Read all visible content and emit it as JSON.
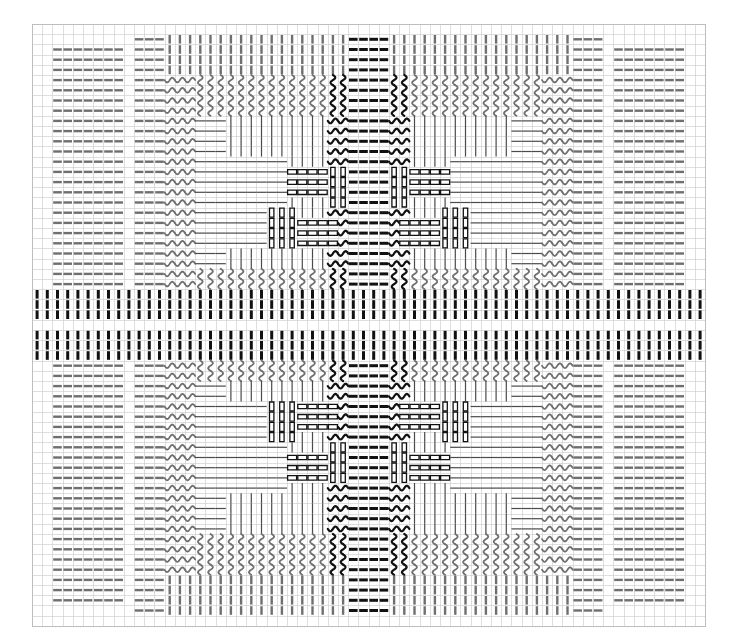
{
  "document": {
    "title": "Woven Textile Draft Pattern Chart",
    "kind": "pattern-grid",
    "canvas": {
      "width": 732,
      "height": 640,
      "background": "#ffffff"
    }
  },
  "grid": {
    "origin_x": 32,
    "origin_y": 24,
    "cell": 10.2,
    "cols": 66,
    "rows": 59,
    "line_color": "#c8c8c8",
    "line_width": 0.6,
    "show": true
  },
  "palette": {
    "dark": "#111111",
    "mid": "#6f6f6f",
    "light_grid": "#c8c8c8",
    "paper": "#ffffff"
  },
  "motifs": {
    "hdash_mid": {
      "name": "horizontal-dash-mid",
      "color": "#6f6f6f",
      "weight": 2.4
    },
    "hdash_dark": {
      "name": "horizontal-dash-dark",
      "color": "#111111",
      "weight": 3.0
    },
    "vdash_mid": {
      "name": "vertical-dash-mid",
      "color": "#6f6f6f",
      "weight": 2.4
    },
    "vdash_dark": {
      "name": "vertical-dash-dark",
      "color": "#111111",
      "weight": 3.0
    },
    "hwave_mid": {
      "name": "horizontal-wave-mid",
      "color": "#6f6f6f",
      "weight": 1.8
    },
    "hwave_dark": {
      "name": "horizontal-wave-dark",
      "color": "#111111",
      "weight": 2.2
    },
    "vwave_mid": {
      "name": "vertical-wave-mid",
      "color": "#6f6f6f",
      "weight": 1.8
    },
    "vwave_dark": {
      "name": "vertical-wave-dark",
      "color": "#111111",
      "weight": 2.2
    },
    "hline_thin": {
      "name": "horizontal-thin-line",
      "color": "#4a4a4a",
      "weight": 1.2
    },
    "vline_thin": {
      "name": "vertical-thin-line",
      "color": "#4a4a4a",
      "weight": 1.2
    },
    "hbar_outline": {
      "name": "horizontal-bar-outline",
      "color": "#111111",
      "weight": 1.3
    },
    "vbar_outline": {
      "name": "vertical-bar-outline",
      "color": "#111111",
      "weight": 1.3
    },
    "blank": {
      "name": "blank-cell",
      "color": "#ffffff",
      "weight": 0
    }
  },
  "chart_data": {
    "type": "heatmap",
    "xlabel": "",
    "ylabel": "",
    "cols": 66,
    "rows": 59,
    "legend": [
      {
        "key": "hdash_mid",
        "label": "horizontal dash (medium)"
      },
      {
        "key": "vdash_mid",
        "label": "vertical dash (medium)"
      },
      {
        "key": "hdash_dark",
        "label": "horizontal dash (dark)"
      },
      {
        "key": "vdash_dark",
        "label": "vertical dash (dark)"
      },
      {
        "key": "hwave_mid",
        "label": "horizontal wave (medium)"
      },
      {
        "key": "vwave_mid",
        "label": "vertical wave (medium)"
      },
      {
        "key": "hwave_dark",
        "label": "horizontal wave (dark)"
      },
      {
        "key": "vwave_dark",
        "label": "vertical wave (dark)"
      },
      {
        "key": "hline_thin",
        "label": "horizontal thin line"
      },
      {
        "key": "vline_thin",
        "label": "vertical thin line"
      },
      {
        "key": "hbar_outline",
        "label": "horizontal outlined bar"
      },
      {
        "key": "vbar_outline",
        "label": "vertical outlined bar"
      },
      {
        "key": "blank",
        "label": "empty"
      }
    ],
    "column_bands": [
      {
        "from": 0,
        "to": 1,
        "band": "margin"
      },
      {
        "from": 2,
        "to": 8,
        "band": "hdash_mid_A"
      },
      {
        "from": 9,
        "to": 9,
        "band": "margin"
      },
      {
        "from": 10,
        "to": 12,
        "band": "hdash_mid_B"
      },
      {
        "from": 13,
        "to": 15,
        "band": "wave_outer"
      },
      {
        "from": 16,
        "to": 24,
        "band": "field_left"
      },
      {
        "from": 25,
        "to": 30,
        "band": "motif_left"
      },
      {
        "from": 31,
        "to": 32,
        "band": "core_left"
      },
      {
        "from": 33,
        "to": 34,
        "band": "core_right"
      },
      {
        "from": 35,
        "to": 40,
        "band": "motif_right"
      },
      {
        "from": 41,
        "to": 49,
        "band": "field_right"
      },
      {
        "from": 50,
        "to": 52,
        "band": "wave_outer"
      },
      {
        "from": 53,
        "to": 55,
        "band": "hdash_mid_B"
      },
      {
        "from": 56,
        "to": 56,
        "band": "margin"
      },
      {
        "from": 57,
        "to": 63,
        "band": "hdash_mid_A"
      },
      {
        "from": 64,
        "to": 65,
        "band": "margin"
      }
    ],
    "row_bands": [
      {
        "from": 0,
        "to": 0,
        "band": "margin"
      },
      {
        "from": 1,
        "to": 4,
        "band": "top_dash"
      },
      {
        "from": 5,
        "to": 8,
        "band": "wave_outer"
      },
      {
        "from": 9,
        "to": 12,
        "band": "field_top"
      },
      {
        "from": 13,
        "to": 19,
        "band": "motif_top"
      },
      {
        "from": 20,
        "to": 23,
        "band": "field_top2"
      },
      {
        "from": 24,
        "to": 25,
        "band": "wave_inner"
      },
      {
        "from": 26,
        "to": 30,
        "band": "center_dark_band"
      },
      {
        "from": 31,
        "to": 34,
        "band": "wave_inner"
      },
      {
        "from": 35,
        "to": 38,
        "band": "field_bottom2"
      },
      {
        "from": 39,
        "to": 45,
        "band": "motif_bottom"
      },
      {
        "from": 46,
        "to": 49,
        "band": "field_bottom"
      },
      {
        "from": 50,
        "to": 53,
        "band": "wave_outer"
      },
      {
        "from": 54,
        "to": 57,
        "band": "bottom_dash"
      },
      {
        "from": 58,
        "to": 58,
        "band": "margin"
      }
    ],
    "symmetry": {
      "horizontal_mirror": true,
      "vertical_mirror": true,
      "center_col": 32.5,
      "center_row": 29
    }
  }
}
